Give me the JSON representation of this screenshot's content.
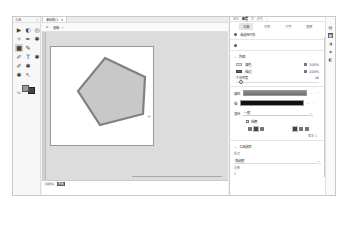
{
  "caption": "Adobe Illustrator",
  "toolbar": {
    "title": "工具",
    "collapse": "«",
    "tools": [
      {
        "name": "selection-tool",
        "glyph": "▶",
        "active": false
      },
      {
        "name": "direct-selection-tool",
        "glyph": "◐",
        "active": false
      },
      {
        "name": "lasso-tool",
        "glyph": "◎",
        "active": false
      },
      {
        "name": "magic-wand-tool",
        "glyph": "✧",
        "active": false
      },
      {
        "name": "pen-tool",
        "glyph": "✒",
        "active": false
      },
      {
        "name": "curvature-tool",
        "glyph": "✱",
        "active": false
      },
      {
        "name": "rectangle-tool",
        "glyph": "■",
        "active": true
      },
      {
        "name": "pencil-tool",
        "glyph": "✎",
        "active": false
      },
      {
        "name": "blank",
        "glyph": "",
        "active": false
      },
      {
        "name": "brush-tool",
        "glyph": "✐",
        "active": false
      },
      {
        "name": "type-tool",
        "glyph": "T",
        "active": false
      },
      {
        "name": "rotate-tool",
        "glyph": "✱",
        "active": false
      },
      {
        "name": "eyedropper-tool",
        "glyph": "✐",
        "active": false
      },
      {
        "name": "scale-tool",
        "glyph": "✱",
        "active": false
      },
      {
        "name": "blank2",
        "glyph": "",
        "active": false
      },
      {
        "name": "hand-tool",
        "glyph": "✱",
        "active": false
      },
      {
        "name": "zoom-tool",
        "glyph": "↖",
        "active": false
      },
      {
        "name": "blank3",
        "glyph": "",
        "active": false
      }
    ],
    "swap_label": "⇆"
  },
  "document": {
    "tab_label": "未标题-1",
    "tab_close": "×",
    "home_icon": "⌂",
    "preset_label": "画板",
    "preset_caret": "⌄",
    "status": {
      "zoom": "100%",
      "artboard": "画板"
    }
  },
  "shape": {
    "fill": "#c8c8c8",
    "stroke": "#808080",
    "points": "54,11 94,30 92,67 49,78 27,44"
  },
  "panel": {
    "header_items": [
      {
        "label": "属性",
        "active": false
      },
      {
        "label": "图层",
        "active": true
      },
      {
        "label": "库",
        "active": false
      },
      {
        "label": "颜色",
        "active": false
      },
      {
        "label": "»",
        "active": false
      }
    ],
    "tabs": [
      {
        "label": "工具",
        "active": true
      },
      {
        "label": "对象",
        "active": false
      },
      {
        "label": "文字",
        "active": false
      },
      {
        "label": "变换",
        "active": false
      }
    ],
    "no_selection": "未选择对象",
    "appearance": {
      "title": "外观",
      "fill_label": "填色",
      "fill_pct": "100%",
      "stroke_label": "描边",
      "stroke_pct": "100%",
      "opacity_label": "不透明度",
      "opacity_value": "86"
    },
    "fill_row": {
      "label": "填充",
      "more": "···"
    },
    "stroke_row": {
      "label": "描",
      "more": "···"
    },
    "blend": {
      "label": "混合",
      "value": "一般",
      "caret": "⌄"
    },
    "checkbox_label": "隔离",
    "misc": "版本 1",
    "tool_options": {
      "title": "工具选项",
      "style_label": "样式",
      "style_value": "角选框",
      "size_label": "边数",
      "size_value": "5"
    }
  },
  "side_icons": [
    "properties-icon",
    "layers-icon",
    "libraries-icon",
    "color-icon",
    "swatches-icon"
  ]
}
